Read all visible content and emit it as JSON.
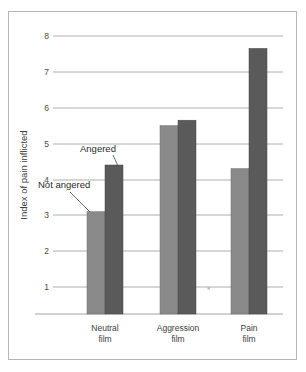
{
  "chart_data": {
    "type": "bar",
    "title": "",
    "subtitle": "",
    "xlabel": "",
    "ylabel": "Index of pain inflicted",
    "categories": [
      "Neutral film",
      "Aggression film",
      "Pain film"
    ],
    "category_lines": [
      [
        "Neutral",
        "film"
      ],
      [
        "Aggression",
        "film"
      ],
      [
        "Pain",
        "film"
      ]
    ],
    "series": [
      {
        "name": "Not angered",
        "values": [
          3.1,
          5.5,
          4.3
        ],
        "color": "#8a8a8a"
      },
      {
        "name": "Angered",
        "values": [
          4.4,
          5.65,
          7.65
        ],
        "color": "#5a5a5a"
      }
    ],
    "ylim": [
      0,
      8
    ],
    "yticks": [
      1,
      2,
      3,
      4,
      5,
      6,
      7,
      8
    ],
    "ytick_labels": [
      "1",
      "2",
      "3",
      "4",
      "5",
      "6",
      "7",
      "8"
    ],
    "grid": true,
    "grid_axis": "y",
    "legend_position": "annotations-inline",
    "annotations": [
      {
        "text": "Angered",
        "points_to": "neutral-film-angered-bar"
      },
      {
        "text": "Not angered",
        "points_to": "neutral-film-not-angered-bar"
      }
    ]
  },
  "axis": {
    "y_title": "Index of pain inflicted",
    "tick_1": "1",
    "tick_2": "2",
    "tick_3": "3",
    "tick_4": "4",
    "tick_5": "5",
    "tick_6": "6",
    "tick_7": "7",
    "tick_8": "8"
  },
  "categories": {
    "neutral_line1": "Neutral",
    "neutral_line2": "film",
    "aggression_line1": "Aggression",
    "aggression_line2": "film",
    "pain_line1": "Pain",
    "pain_line2": "film"
  },
  "annotations": {
    "angered": "Angered",
    "not_angered": "Not angered"
  },
  "colors": {
    "not_angered_bar": "#8a8a8a",
    "angered_bar": "#5a5a5a",
    "gridline": "#9a9a9a",
    "frame": "#b5b5b5",
    "background": "#ffffff"
  }
}
